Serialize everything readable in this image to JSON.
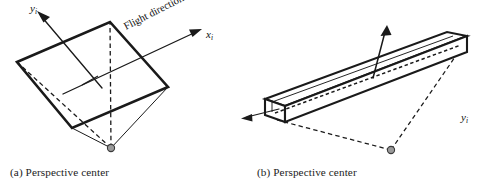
{
  "figure": {
    "background_color": "#ffffff",
    "stroke_color": "#1a1a1a",
    "marker_fill_color": "#9a9a9a",
    "marker_stroke_color": "#3a3a3a"
  },
  "panel_a": {
    "caption": "(a) Perspective center",
    "caption_index": "(a)",
    "caption_text": "Perspective center",
    "flight_label": "Flight direction",
    "x_axis": {
      "symbol": "x",
      "subscript": "i"
    },
    "y_axis": {
      "symbol": "y",
      "subscript": "i"
    },
    "description": "Frame image: tilted quadrilateral image plane with perspective center below and projection rays"
  },
  "panel_b": {
    "caption": "(b) Perspective center",
    "caption_index": "(b)",
    "caption_text": "Perspective center",
    "flight_label": "Flight direction",
    "x_axis": {
      "symbol": "x",
      "subscript": "i"
    },
    "y_axis": {
      "symbol": "y",
      "subscript": "i"
    },
    "description": "Linear array / pushbroom image: long narrow strip with perspective center below and projection rays"
  }
}
